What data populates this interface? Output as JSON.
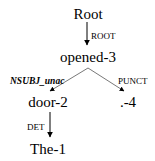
{
  "diagram": {
    "type": "dependency-tree",
    "nodes": {
      "root": "Root",
      "opened": "opened-3",
      "door": "door-2",
      "punct": ".-4",
      "the": "The-1"
    },
    "edges": {
      "root_opened": "ROOT",
      "opened_door": "NSUBJ_unac",
      "opened_punct": "PUNCT",
      "door_the": "DET"
    },
    "colors": {
      "text": "#000000",
      "edge": "#000000",
      "background": "#ffffff"
    }
  }
}
